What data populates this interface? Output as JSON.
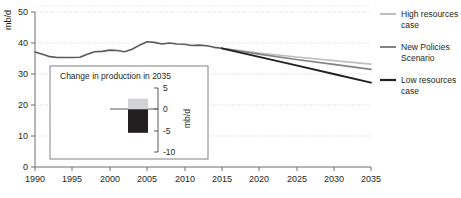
{
  "chart_data": {
    "type": "line",
    "title": "",
    "xlabel": "",
    "ylabel": "mb/d",
    "xlim": [
      1990,
      2035
    ],
    "ylim": [
      0,
      50
    ],
    "grid": true,
    "xticks": [
      "1990",
      "1995",
      "2000",
      "2005",
      "2010",
      "2015",
      "2020",
      "2025",
      "2030",
      "2035"
    ],
    "yticks": [
      "0",
      "10",
      "20",
      "30",
      "40",
      "50"
    ],
    "legend_position": "right",
    "x": [
      1990,
      1991,
      1992,
      1993,
      1994,
      1995,
      1996,
      1997,
      1998,
      1999,
      2000,
      2001,
      2002,
      2003,
      2004,
      2005,
      2006,
      2007,
      2008,
      2009,
      2010,
      2011,
      2012,
      2013,
      2014,
      2015
    ],
    "series": [
      {
        "name": "Historical",
        "color": "#58595b",
        "values": [
          37.1,
          36.4,
          35.6,
          35.3,
          35.3,
          35.3,
          35.4,
          36.4,
          37.2,
          37.3,
          37.7,
          37.6,
          37.2,
          38.0,
          39.3,
          40.4,
          40.2,
          39.7,
          40.0,
          39.7,
          39.6,
          39.2,
          39.3,
          39.1,
          38.6,
          38.3
        ],
        "line_width": 1.6
      },
      {
        "name": "High resources case",
        "color": "#bcbec0",
        "x": [
          2015,
          2020,
          2025,
          2030,
          2035
        ],
        "values": [
          38.3,
          36.8,
          35.5,
          34.3,
          33.2
        ],
        "line_width": 1.6
      },
      {
        "name": "New Policies Scenario",
        "color": "#808285",
        "x": [
          2015,
          2020,
          2025,
          2030,
          2035
        ],
        "values": [
          38.3,
          36.4,
          34.7,
          33.1,
          31.5
        ],
        "line_width": 1.6
      },
      {
        "name": "Low resources case",
        "color": "#231f20",
        "x": [
          2015,
          2020,
          2025,
          2030,
          2035
        ],
        "values": [
          38.3,
          35.5,
          32.8,
          30.0,
          27.2
        ],
        "line_width": 1.8
      }
    ],
    "inset": {
      "type": "bar",
      "title": "Change in production in 2035",
      "ylabel": "mb/d",
      "ylim": [
        -10,
        5
      ],
      "yticks": [
        "5",
        "0",
        "-5",
        "-10"
      ],
      "categories": [
        "High resources case",
        "Low resources case"
      ],
      "values": [
        2.5,
        -5.5
      ],
      "colors": [
        "#d1d3d4",
        "#231f20"
      ]
    }
  },
  "legend": {
    "items": [
      {
        "label_line1": "High resources",
        "label_line2": "case",
        "color": "#bcbec0"
      },
      {
        "label_line1": "New Policies",
        "label_line2": "Scenario",
        "color": "#808285"
      },
      {
        "label_line1": "Low resources",
        "label_line2": "case",
        "color": "#231f20"
      }
    ]
  },
  "axes": {
    "y_unit": "mb/d",
    "y_tick_0": "0",
    "y_tick_10": "10",
    "y_tick_20": "20",
    "y_tick_30": "30",
    "y_tick_40": "40",
    "y_tick_50": "50",
    "x_tick_1990": "1990",
    "x_tick_1995": "1995",
    "x_tick_2000": "2000",
    "x_tick_2005": "2005",
    "x_tick_2010": "2010",
    "x_tick_2015": "2015",
    "x_tick_2020": "2020",
    "x_tick_2025": "2025",
    "x_tick_2030": "2030",
    "x_tick_2035": "2035"
  },
  "inset_labels": {
    "title": "Change in production in 2035",
    "unit": "mb/d",
    "tick_pos5": "5",
    "tick_0": "0",
    "tick_neg5": "-5",
    "tick_neg10": "-10"
  }
}
